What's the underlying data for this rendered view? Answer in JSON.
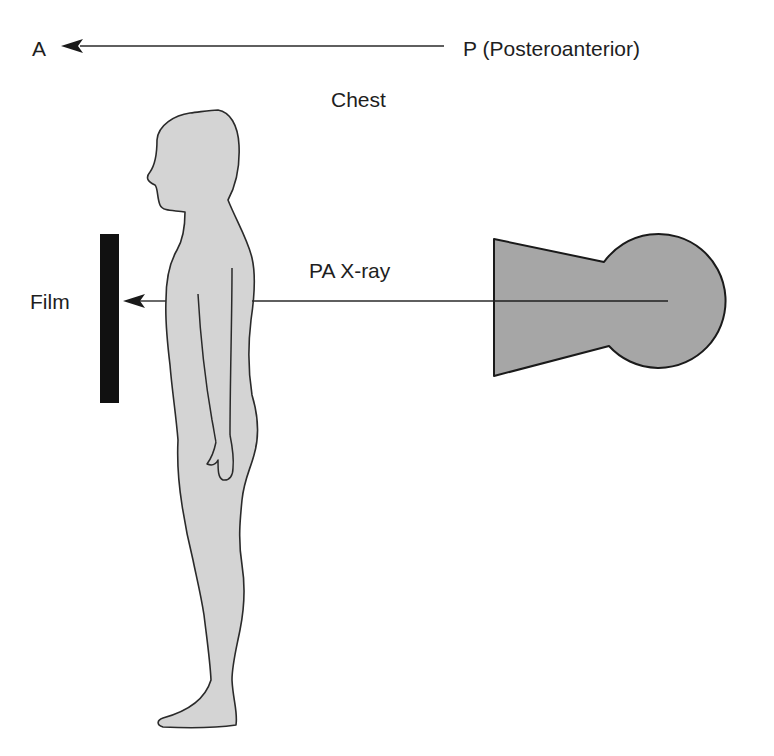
{
  "labels": {
    "anterior": "A",
    "posterior": "P (Posteroanterior)",
    "chest": "Chest",
    "beam": "PA X-ray",
    "film": "Film"
  },
  "figure": {
    "direction_arrow": "Points from posterior (P) to anterior (A)",
    "xray_source": "X-ray tube on right, beam passes through chest toward film on left",
    "film_position": "Film plate in front of the chest"
  },
  "colors": {
    "background": "#ffffff",
    "body_fill": "#d4d4d4",
    "tube_fill": "#a6a6a6",
    "film_fill": "#111111",
    "outline": "#2a2a2a",
    "text": "#1e1e1e"
  }
}
